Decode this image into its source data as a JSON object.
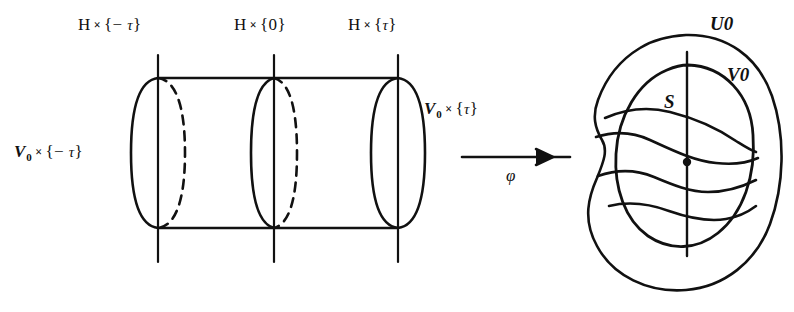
{
  "figure": {
    "ink_color": "#111111",
    "background_color": "#ffffff"
  },
  "labels": {
    "top_left": {
      "base": "H",
      "times": "×",
      "open": "{",
      "sign": "−",
      "tau": "τ",
      "close": "}"
    },
    "top_mid": {
      "base": "H",
      "times": "×",
      "open": "{",
      "value": "0",
      "close": "}"
    },
    "top_right": {
      "base": "H",
      "times": "×",
      "open": "{",
      "tau": "τ",
      "close": "}"
    },
    "left_side": {
      "base": "V",
      "sub": "0",
      "times": "×",
      "open": "{",
      "sign": "−",
      "tau": "τ",
      "close": "}"
    },
    "right_cap": {
      "base": "V",
      "sub": "0",
      "times": "×",
      "open": "{",
      "tau": "τ",
      "close": "}"
    },
    "map_arrow": {
      "symbol": "φ"
    },
    "blob_outer": {
      "base": "U",
      "sub": "0"
    },
    "blob_inner": {
      "base": "V",
      "sub": "0"
    },
    "blob_surface": {
      "base": "S"
    }
  },
  "geometry": {
    "cylinder": {
      "top_y": 78,
      "bottom_y": 228,
      "left_x": 158,
      "right_x": 398,
      "cap_rx": 26,
      "mid_cap_rx": 22,
      "mid_cap_x": 274,
      "vertical_lines_x": [
        158,
        274,
        398
      ],
      "vertical_top_y": 55,
      "vertical_bottom_y": 262
    },
    "arrow": {
      "x1": 460,
      "x2": 570,
      "y": 157
    },
    "blob": {
      "cx": 690,
      "cy": 160,
      "rx": 90,
      "ry": 130
    }
  }
}
